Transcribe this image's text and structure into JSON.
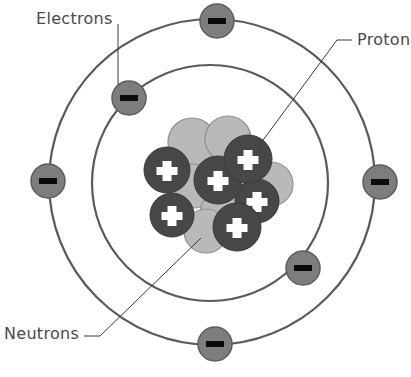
{
  "diagram": {
    "type": "atom-model",
    "labels": {
      "electrons": "Electrons",
      "proton": "Proton",
      "neutrons": "Neutrons"
    },
    "center": [
      208,
      182
    ],
    "orbits": [
      {
        "name": "inner-orbit",
        "radius": 118
      },
      {
        "name": "outer-orbit",
        "radius": 162
      }
    ],
    "electrons": [
      {
        "orbit": "outer",
        "x": 217,
        "y": 20
      },
      {
        "orbit": "outer",
        "x": 47,
        "y": 181
      },
      {
        "orbit": "outer",
        "x": 380,
        "y": 182
      },
      {
        "orbit": "outer",
        "x": 215,
        "y": 343
      },
      {
        "orbit": "inner",
        "x": 128,
        "y": 98
      },
      {
        "orbit": "inner",
        "x": 302,
        "y": 267
      }
    ],
    "electron_symbol": "−",
    "proton_symbol": "+",
    "proton_count": 6,
    "neutron_count": 6,
    "colors": {
      "orbit": "#5a5a5a",
      "electron_fill": "#7d7d7d",
      "electron_stroke": "#5e5e5e",
      "proton_fill": "#474747",
      "neutron_fill": "#b9b9b9",
      "neutron_stroke": "#8f8f8f",
      "label_text": "#4a4a4a",
      "leader_line": "#3a3a3a"
    }
  }
}
